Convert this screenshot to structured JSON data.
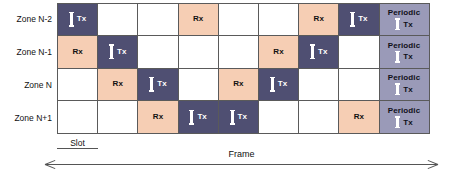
{
  "diagram": {
    "cell_kinds": {
      "empty": "",
      "rx": "Rx",
      "tx": "Tx",
      "periodic": "Periodic"
    },
    "colors": {
      "tx": "#4f4f72",
      "rx": "#f6ceb4",
      "empty": "#ffffff",
      "periodic": "#9a9ab8",
      "border": "#5a5a5a",
      "text": "#111111"
    },
    "icons": {
      "tx_burst": "tx-burst-icon"
    },
    "rows": [
      {
        "label": "Zone N-2",
        "cells": [
          {
            "kind": "tx",
            "text": "Tx"
          },
          {
            "kind": "empty",
            "text": ""
          },
          {
            "kind": "empty",
            "text": ""
          },
          {
            "kind": "rx",
            "text": "Rx"
          },
          {
            "kind": "empty",
            "text": ""
          },
          {
            "kind": "empty",
            "text": ""
          },
          {
            "kind": "rx",
            "text": "Rx"
          },
          {
            "kind": "tx",
            "text": "Tx"
          },
          {
            "kind": "periodic",
            "text": "Periodic",
            "text2": "Tx"
          }
        ]
      },
      {
        "label": "Zone N-1",
        "cells": [
          {
            "kind": "rx",
            "text": "Rx"
          },
          {
            "kind": "tx",
            "text": "Tx"
          },
          {
            "kind": "empty",
            "text": ""
          },
          {
            "kind": "empty",
            "text": ""
          },
          {
            "kind": "empty",
            "text": ""
          },
          {
            "kind": "rx",
            "text": "Rx"
          },
          {
            "kind": "tx",
            "text": "Tx"
          },
          {
            "kind": "empty",
            "text": ""
          },
          {
            "kind": "periodic",
            "text": "Periodic",
            "text2": "Tx"
          }
        ]
      },
      {
        "label": "Zone N",
        "cells": [
          {
            "kind": "empty",
            "text": ""
          },
          {
            "kind": "rx",
            "text": "Rx"
          },
          {
            "kind": "tx",
            "text": "Tx"
          },
          {
            "kind": "empty",
            "text": ""
          },
          {
            "kind": "rx",
            "text": "Rx"
          },
          {
            "kind": "tx",
            "text": "Tx"
          },
          {
            "kind": "empty",
            "text": ""
          },
          {
            "kind": "empty",
            "text": ""
          },
          {
            "kind": "periodic",
            "text": "Periodic",
            "text2": "Tx"
          }
        ]
      },
      {
        "label": "Zone N+1",
        "cells": [
          {
            "kind": "empty",
            "text": ""
          },
          {
            "kind": "empty",
            "text": ""
          },
          {
            "kind": "rx",
            "text": "Rx"
          },
          {
            "kind": "tx",
            "text": "Tx"
          },
          {
            "kind": "tx",
            "text": "Tx"
          },
          {
            "kind": "empty",
            "text": ""
          },
          {
            "kind": "empty",
            "text": ""
          },
          {
            "kind": "rx",
            "text": "Rx"
          },
          {
            "kind": "periodic",
            "text": "Periodic",
            "text2": "Tx"
          }
        ]
      }
    ],
    "annotations": {
      "slot_label": "Slot",
      "frame_label": "Frame"
    }
  }
}
